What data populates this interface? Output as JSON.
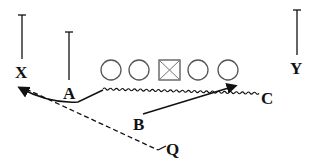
{
  "diagram": {
    "type": "football-play",
    "colors": {
      "ink": "#111111",
      "symbol": "#555555"
    },
    "players": [
      {
        "id": "X",
        "label": "X"
      },
      {
        "id": "A",
        "label": "A"
      },
      {
        "id": "Y",
        "label": "Y"
      },
      {
        "id": "B",
        "label": "B"
      },
      {
        "id": "C",
        "label": "C"
      },
      {
        "id": "Q",
        "label": "Q"
      }
    ],
    "line": [
      {
        "type": "circle"
      },
      {
        "type": "circle"
      },
      {
        "type": "center-square"
      },
      {
        "type": "circle"
      },
      {
        "type": "circle"
      }
    ],
    "routes": [
      {
        "player": "A",
        "style": "motion-zigzag-then-solid-arrow",
        "target": "X"
      },
      {
        "player": "B",
        "style": "solid-arrow"
      },
      {
        "player": "Q",
        "style": "dashed-pass",
        "target": "X"
      }
    ]
  }
}
